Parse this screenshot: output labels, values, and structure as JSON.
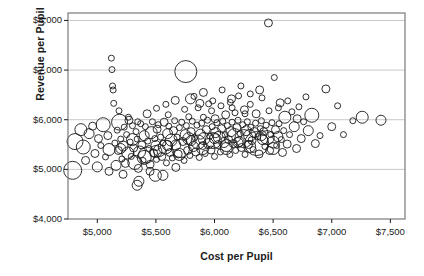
{
  "chart_data": {
    "type": "scatter",
    "title": "",
    "xlabel": "Cost per Pupil",
    "ylabel": "Revenue per Pupil",
    "xlim": [
      4750,
      7625
    ],
    "ylim": [
      4000,
      8150
    ],
    "xticks": [
      "$5,000",
      "$5,500",
      "$6,000",
      "$6,500",
      "$7,000",
      "$7,500"
    ],
    "xtick_values": [
      5000,
      5500,
      6000,
      6500,
      7000,
      7500
    ],
    "yticks": [
      "$4,000",
      "$5,000",
      "$6,000",
      "$7,000",
      "$8,000"
    ],
    "ytick_values": [
      4000,
      5000,
      6000,
      7000,
      8000
    ],
    "grid": "horizontal",
    "legend": "none",
    "marker": "open-circle",
    "marker_stroke": "#1a1a1a",
    "marker_fill": "none",
    "size_encoding": "enrollment (bubble area)",
    "frame_color": "#7a7a7a",
    "grid_color": "#c8c8c8",
    "points": [
      [
        4790,
        4980,
        9
      ],
      [
        4810,
        5560,
        8
      ],
      [
        4860,
        5800,
        6
      ],
      [
        4880,
        5450,
        7
      ],
      [
        4900,
        5180,
        4
      ],
      [
        4930,
        5720,
        5
      ],
      [
        4960,
        5870,
        4
      ],
      [
        4980,
        5320,
        4
      ],
      [
        5000,
        5050,
        5
      ],
      [
        5010,
        5620,
        4
      ],
      [
        5030,
        5480,
        3
      ],
      [
        5050,
        5900,
        7
      ],
      [
        5070,
        5250,
        3
      ],
      [
        5090,
        5680,
        4
      ],
      [
        5100,
        4960,
        4
      ],
      [
        5120,
        7240,
        3
      ],
      [
        5125,
        7010,
        3
      ],
      [
        5130,
        6680,
        3
      ],
      [
        5135,
        6600,
        3
      ],
      [
        5140,
        6330,
        3
      ],
      [
        5150,
        5530,
        3
      ],
      [
        5160,
        5080,
        5
      ],
      [
        5170,
        5790,
        3
      ],
      [
        5180,
        5380,
        4
      ],
      [
        5190,
        5950,
        8
      ],
      [
        5200,
        5610,
        3
      ],
      [
        5210,
        5210,
        3
      ],
      [
        5220,
        5470,
        5
      ],
      [
        5230,
        5850,
        3
      ],
      [
        5240,
        5120,
        4
      ],
      [
        5250,
        5700,
        3
      ],
      [
        5260,
        5330,
        6
      ],
      [
        5270,
        5990,
        4
      ],
      [
        5280,
        5550,
        3
      ],
      [
        5290,
        5260,
        3
      ],
      [
        5300,
        5880,
        3
      ],
      [
        5310,
        5430,
        4
      ],
      [
        5320,
        5140,
        7
      ],
      [
        5330,
        5760,
        3
      ],
      [
        5340,
        5610,
        3
      ],
      [
        5350,
        5020,
        4
      ],
      [
        5355,
        4760,
        5
      ],
      [
        5360,
        5350,
        6
      ],
      [
        5370,
        5920,
        3
      ],
      [
        5380,
        5490,
        4
      ],
      [
        5390,
        5180,
        3
      ],
      [
        5400,
        5680,
        5
      ],
      [
        5410,
        5860,
        3
      ],
      [
        5420,
        5290,
        8
      ],
      [
        5430,
        5570,
        3
      ],
      [
        5440,
        5420,
        3
      ],
      [
        5450,
        5100,
        4
      ],
      [
        5460,
        5740,
        6
      ],
      [
        5470,
        5960,
        3
      ],
      [
        5480,
        5330,
        4
      ],
      [
        5490,
        5620,
        3
      ],
      [
        5495,
        4880,
        6
      ],
      [
        5500,
        5480,
        5
      ],
      [
        5505,
        5200,
        3
      ],
      [
        5510,
        5810,
        4
      ],
      [
        5520,
        5900,
        3
      ],
      [
        5530,
        5380,
        6
      ],
      [
        5540,
        5650,
        3
      ],
      [
        5550,
        5260,
        4
      ],
      [
        5560,
        5530,
        3
      ],
      [
        5570,
        5950,
        4
      ],
      [
        5580,
        5450,
        7
      ],
      [
        5590,
        5130,
        3
      ],
      [
        5600,
        5720,
        5
      ],
      [
        5605,
        6100,
        3
      ],
      [
        5610,
        5870,
        3
      ],
      [
        5620,
        5340,
        4
      ],
      [
        5630,
        5590,
        6
      ],
      [
        5640,
        5230,
        3
      ],
      [
        5650,
        5780,
        4
      ],
      [
        5660,
        5980,
        3
      ],
      [
        5670,
        5490,
        5
      ],
      [
        5680,
        5650,
        3
      ],
      [
        5690,
        5310,
        4
      ],
      [
        5700,
        5840,
        3
      ],
      [
        5710,
        5420,
        9
      ],
      [
        5720,
        5950,
        3
      ],
      [
        5730,
        5560,
        4
      ],
      [
        5740,
        5180,
        3
      ],
      [
        5750,
        5700,
        5
      ],
      [
        5755,
        6970,
        11
      ],
      [
        5760,
        5880,
        3
      ],
      [
        5770,
        5380,
        4
      ],
      [
        5780,
        5620,
        6
      ],
      [
        5790,
        5280,
        3
      ],
      [
        5795,
        6420,
        5
      ],
      [
        5800,
        5760,
        4
      ],
      [
        5810,
        5970,
        3
      ],
      [
        5820,
        5460,
        5
      ],
      [
        5830,
        5640,
        3
      ],
      [
        5840,
        5350,
        4
      ],
      [
        5850,
        5890,
        3
      ],
      [
        5860,
        5550,
        7
      ],
      [
        5870,
        5240,
        3
      ],
      [
        5875,
        6330,
        4
      ],
      [
        5880,
        5710,
        5
      ],
      [
        5890,
        5930,
        3
      ],
      [
        5900,
        5480,
        4
      ],
      [
        5905,
        6050,
        3
      ],
      [
        5910,
        5620,
        6
      ],
      [
        5920,
        5320,
        3
      ],
      [
        5930,
        5800,
        4
      ],
      [
        5940,
        5990,
        3
      ],
      [
        5950,
        5520,
        5
      ],
      [
        5960,
        5670,
        3
      ],
      [
        5970,
        5390,
        4
      ],
      [
        5975,
        6180,
        3
      ],
      [
        5980,
        5860,
        3
      ],
      [
        5990,
        5580,
        8
      ],
      [
        6000,
        5260,
        3
      ],
      [
        6005,
        6020,
        4
      ],
      [
        6010,
        5740,
        5
      ],
      [
        6020,
        5940,
        3
      ],
      [
        6030,
        5500,
        4
      ],
      [
        6040,
        5650,
        6
      ],
      [
        6050,
        5350,
        3
      ],
      [
        6055,
        6280,
        3
      ],
      [
        6060,
        5820,
        4
      ],
      [
        6070,
        5970,
        3
      ],
      [
        6080,
        5540,
        5
      ],
      [
        6090,
        5700,
        3
      ],
      [
        6095,
        6100,
        4
      ],
      [
        6100,
        5420,
        6
      ],
      [
        6110,
        5880,
        3
      ],
      [
        6120,
        5600,
        4
      ],
      [
        6130,
        5300,
        3
      ],
      [
        6135,
        6350,
        3
      ],
      [
        6140,
        5760,
        5
      ],
      [
        6150,
        5950,
        3
      ],
      [
        6160,
        5520,
        4
      ],
      [
        6170,
        5680,
        7
      ],
      [
        6175,
        6140,
        3
      ],
      [
        6180,
        5380,
        3
      ],
      [
        6190,
        5840,
        4
      ],
      [
        6200,
        5990,
        3
      ],
      [
        6205,
        6480,
        3
      ],
      [
        6210,
        5560,
        5
      ],
      [
        6220,
        5720,
        3
      ],
      [
        6230,
        5440,
        4
      ],
      [
        6240,
        5900,
        3
      ],
      [
        6250,
        5620,
        9
      ],
      [
        6255,
        6200,
        4
      ],
      [
        6260,
        5300,
        3
      ],
      [
        6270,
        5780,
        5
      ],
      [
        6280,
        5960,
        3
      ],
      [
        6290,
        5500,
        4
      ],
      [
        6300,
        5680,
        6
      ],
      [
        6305,
        6310,
        3
      ],
      [
        6310,
        5850,
        3
      ],
      [
        6320,
        5580,
        4
      ],
      [
        6330,
        5400,
        3
      ],
      [
        6340,
        5740,
        5
      ],
      [
        6350,
        5930,
        3
      ],
      [
        6355,
        6120,
        4
      ],
      [
        6360,
        5520,
        12
      ],
      [
        6370,
        5660,
        3
      ],
      [
        6380,
        5310,
        4
      ],
      [
        6390,
        5820,
        3
      ],
      [
        6400,
        5980,
        3
      ],
      [
        6405,
        6440,
        3
      ],
      [
        6410,
        5600,
        5
      ],
      [
        6420,
        5760,
        4
      ],
      [
        6430,
        5460,
        3
      ],
      [
        6440,
        5890,
        3
      ],
      [
        6450,
        5640,
        7
      ],
      [
        6460,
        7950,
        4
      ],
      [
        6470,
        5380,
        4
      ],
      [
        6480,
        5700,
        3
      ],
      [
        6490,
        5940,
        3
      ],
      [
        6500,
        5550,
        6
      ],
      [
        6510,
        6850,
        3
      ],
      [
        6520,
        5800,
        4
      ],
      [
        6530,
        5480,
        3
      ],
      [
        6540,
        5660,
        5
      ],
      [
        6550,
        5920,
        3
      ],
      [
        6560,
        6340,
        4
      ],
      [
        6570,
        5600,
        3
      ],
      [
        6580,
        5340,
        4
      ],
      [
        6590,
        5780,
        3
      ],
      [
        6600,
        6050,
        6
      ],
      [
        6620,
        5510,
        4
      ],
      [
        6640,
        5700,
        3
      ],
      [
        6660,
        6160,
        3
      ],
      [
        6680,
        5860,
        5
      ],
      [
        6700,
        5420,
        4
      ],
      [
        6720,
        6260,
        3
      ],
      [
        6740,
        5620,
        4
      ],
      [
        6760,
        5960,
        3
      ],
      [
        6780,
        6460,
        3
      ],
      [
        6800,
        5780,
        5
      ],
      [
        6830,
        6090,
        7
      ],
      [
        6860,
        5520,
        4
      ],
      [
        6900,
        5680,
        3
      ],
      [
        6950,
        6620,
        4
      ],
      [
        7000,
        5860,
        4
      ],
      [
        7050,
        6280,
        3
      ],
      [
        7100,
        5700,
        3
      ],
      [
        7180,
        5980,
        3
      ],
      [
        7260,
        6050,
        6
      ],
      [
        7420,
        5990,
        5
      ],
      [
        5185,
        6180,
        3
      ],
      [
        5265,
        6050,
        3
      ],
      [
        5345,
        5960,
        3
      ],
      [
        5425,
        6120,
        4
      ],
      [
        5505,
        6230,
        3
      ],
      [
        5585,
        6310,
        3
      ],
      [
        5665,
        6390,
        4
      ],
      [
        5745,
        6210,
        3
      ],
      [
        5825,
        6470,
        3
      ],
      [
        5905,
        6550,
        4
      ],
      [
        5985,
        6380,
        3
      ],
      [
        6065,
        6600,
        3
      ],
      [
        6145,
        6420,
        4
      ],
      [
        6225,
        6680,
        3
      ],
      [
        6305,
        6520,
        3
      ],
      [
        6385,
        6600,
        4
      ],
      [
        6465,
        6180,
        3
      ],
      [
        6545,
        6240,
        3
      ],
      [
        6625,
        6380,
        3
      ],
      [
        6705,
        6020,
        4
      ],
      [
        5100,
        5400,
        6
      ],
      [
        5200,
        5420,
        5
      ],
      [
        5300,
        5600,
        6
      ],
      [
        5400,
        5240,
        7
      ],
      [
        5500,
        5360,
        6
      ],
      [
        5600,
        5480,
        5
      ],
      [
        5700,
        5300,
        6
      ],
      [
        5800,
        5580,
        5
      ],
      [
        5900,
        5420,
        6
      ],
      [
        6000,
        5620,
        5
      ],
      [
        6100,
        5480,
        6
      ],
      [
        6200,
        5540,
        5
      ],
      [
        6300,
        5460,
        6
      ],
      [
        6400,
        5680,
        5
      ],
      [
        6500,
        5420,
        6
      ],
      [
        5340,
        4680,
        5
      ],
      [
        5450,
        4960,
        4
      ],
      [
        5560,
        4880,
        5
      ],
      [
        5670,
        5040,
        4
      ],
      [
        5220,
        4900,
        4
      ],
      [
        6150,
        6240,
        3
      ],
      [
        6260,
        6120,
        3
      ],
      [
        5950,
        6320,
        3
      ],
      [
        5860,
        6240,
        3
      ],
      [
        5780,
        6060,
        3
      ]
    ]
  }
}
